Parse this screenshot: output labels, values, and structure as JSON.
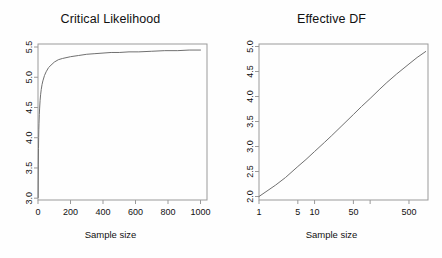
{
  "figure": {
    "background_color": "#fefefe",
    "axis_color": "#9a9a9a",
    "curve_color": "#707070",
    "text_color": "#111111"
  },
  "chart_data": [
    {
      "type": "line",
      "panel": "left",
      "title": "Critical Likelihood",
      "xlabel": "Sample size",
      "ylabel": "",
      "xscale": "linear",
      "yscale": "linear",
      "xlim": [
        0,
        1040
      ],
      "ylim": [
        2.97,
        5.55
      ],
      "grid": false,
      "legend": "none",
      "xticks": [
        0,
        200,
        400,
        600,
        800,
        1000
      ],
      "xticklabels": [
        "0",
        "200",
        "400",
        "600",
        "800",
        "1000"
      ],
      "yticks": [
        3.0,
        3.5,
        4.0,
        4.5,
        5.0,
        5.5
      ],
      "yticklabels": [
        "3.0",
        "3.5",
        "4.0",
        "4.5",
        "5.0",
        "5.5"
      ],
      "x": [
        1,
        2,
        3,
        4,
        5,
        6,
        8,
        10,
        13,
        16,
        20,
        25,
        30,
        40,
        50,
        65,
        80,
        100,
        125,
        150,
        200,
        250,
        300,
        350,
        400,
        450,
        500,
        560,
        620,
        700,
        780,
        860,
        930,
        1000
      ],
      "y": [
        3.01,
        3.55,
        3.82,
        4.0,
        4.13,
        4.23,
        4.38,
        4.49,
        4.62,
        4.71,
        4.8,
        4.88,
        4.94,
        5.03,
        5.09,
        5.16,
        5.2,
        5.25,
        5.29,
        5.31,
        5.34,
        5.36,
        5.38,
        5.39,
        5.4,
        5.41,
        5.41,
        5.42,
        5.42,
        5.43,
        5.44,
        5.44,
        5.45,
        5.45
      ]
    },
    {
      "type": "line",
      "panel": "right",
      "title": "Effective DF",
      "xlabel": "Sample size",
      "ylabel": "",
      "xscale": "log",
      "yscale": "linear",
      "xlim": [
        1,
        1100
      ],
      "ylim": [
        1.93,
        5.05
      ],
      "grid": false,
      "legend": "none",
      "xticks": [
        1,
        5,
        10,
        50,
        100,
        500
      ],
      "xticklabels": [
        "1",
        "5",
        "10",
        "50",
        "",
        "500"
      ],
      "yticks": [
        2.0,
        2.5,
        3.0,
        3.5,
        4.0,
        4.5,
        5.0
      ],
      "yticklabels": [
        "2.0",
        "2.5",
        "3.0",
        "3.5",
        "4.0",
        "4.5",
        "5.0"
      ],
      "x": [
        1,
        2,
        3,
        5,
        7,
        10,
        15,
        20,
        30,
        50,
        70,
        100,
        150,
        200,
        300,
        500,
        700,
        1000
      ],
      "y": [
        2.0,
        2.23,
        2.38,
        2.6,
        2.74,
        2.9,
        3.08,
        3.21,
        3.4,
        3.64,
        3.8,
        3.96,
        4.15,
        4.28,
        4.45,
        4.65,
        4.78,
        4.9
      ]
    }
  ]
}
